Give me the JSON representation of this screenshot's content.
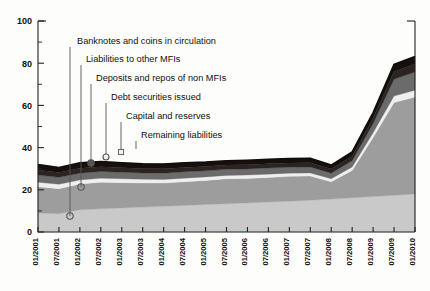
{
  "chart_data": {
    "type": "area",
    "title": "",
    "subtitle": "",
    "xlabel": "",
    "ylabel": "",
    "ylim": [
      0,
      100
    ],
    "yticks": [
      0,
      20,
      40,
      60,
      80,
      100
    ],
    "yticks_minor": [
      10,
      30,
      50,
      70,
      90
    ],
    "grid": false,
    "legend_position": "annotations-with-leader-lines",
    "stacked": true,
    "categories": [
      "01/2001",
      "07/2001",
      "01/2002",
      "07/2002",
      "01/2003",
      "07/2003",
      "01/2004",
      "07/2004",
      "01/2005",
      "07/2005",
      "01/2006",
      "07/2006",
      "01/2007",
      "07/2007",
      "01/2008",
      "07/2008",
      "01/2009",
      "07/2009",
      "01/2010"
    ],
    "series": [
      {
        "name": "Banknotes and coins in circulation",
        "color": "#c9c9c9",
        "values": [
          9.0,
          8.6,
          10.5,
          11.0,
          11.4,
          11.8,
          12.2,
          12.6,
          13.0,
          13.4,
          13.8,
          14.2,
          14.6,
          15.0,
          15.6,
          16.2,
          16.8,
          17.4,
          18.0
        ]
      },
      {
        "name": "Liabilities to other MFIs",
        "color": "#9d9d9d",
        "values": [
          12.4,
          11.9,
          12.2,
          12.6,
          12.0,
          11.4,
          11.0,
          11.2,
          11.4,
          11.8,
          11.6,
          11.6,
          11.8,
          11.5,
          8.2,
          13.0,
          28.0,
          44.0,
          46.0
        ]
      },
      {
        "name": "Deposits and repos of non MFIs",
        "color": "#efefef",
        "values": [
          2.2,
          2.1,
          2.0,
          1.9,
          1.8,
          1.8,
          1.7,
          1.7,
          1.7,
          1.6,
          1.6,
          1.6,
          1.5,
          1.5,
          1.4,
          1.6,
          2.2,
          3.0,
          3.2
        ]
      },
      {
        "name": "Debt securities issued",
        "color": "#6b6b6b",
        "values": [
          3.4,
          3.3,
          3.2,
          3.2,
          3.1,
          3.0,
          3.0,
          3.0,
          2.9,
          2.9,
          2.9,
          2.9,
          2.8,
          2.8,
          2.7,
          3.0,
          4.4,
          8.0,
          8.6
        ]
      },
      {
        "name": "Capital and reserves",
        "color": "#2c2420",
        "values": [
          2.4,
          2.3,
          2.3,
          2.2,
          2.2,
          2.1,
          2.1,
          2.1,
          2.0,
          2.0,
          2.0,
          2.0,
          2.0,
          2.0,
          1.9,
          2.1,
          2.6,
          3.6,
          3.8
        ]
      },
      {
        "name": "Remaining liabilities",
        "color": "#15100e",
        "values": [
          2.6,
          2.3,
          2.6,
          2.5,
          2.3,
          2.2,
          2.2,
          2.2,
          2.1,
          2.1,
          2.1,
          2.1,
          2.1,
          2.1,
          1.9,
          2.1,
          2.6,
          3.4,
          3.6
        ]
      }
    ],
    "annotations": [
      {
        "label": "Banknotes and coins in circulation",
        "text_x": 77,
        "text_y": 44,
        "leader_x": 70,
        "leader_y0": 47,
        "leader_y1": 216,
        "marker": "open",
        "marker_y": 216
      },
      {
        "label": "Liabilities to other MFIs",
        "text_x": 86,
        "text_y": 62,
        "leader_x": 81,
        "leader_y0": 65,
        "leader_y1": 187,
        "marker": "open",
        "marker_y": 187
      },
      {
        "label": "Deposits and repos of non MFIs",
        "text_x": 96,
        "text_y": 81,
        "leader_x": 91,
        "leader_y0": 84,
        "leader_y1": 163,
        "marker": "filled",
        "marker_y": 163
      },
      {
        "label": "Debt securities issued",
        "text_x": 111,
        "text_y": 100,
        "leader_x": 106,
        "leader_y0": 103,
        "leader_y1": 157,
        "marker": "light",
        "marker_y": 157
      },
      {
        "label": "Capital and reserves",
        "text_x": 126,
        "text_y": 119,
        "leader_x": 121,
        "leader_y0": 122,
        "leader_y1": 152,
        "marker": "square",
        "marker_y": 152
      },
      {
        "label": "Remaining liabilities",
        "text_x": 141,
        "text_y": 138,
        "leader_x": 136,
        "leader_y0": 141,
        "leader_y1": 149,
        "marker": "none",
        "marker_y": 149
      }
    ]
  },
  "plot": {
    "left": 38,
    "right": 415,
    "top": 21,
    "bottom": 232
  }
}
